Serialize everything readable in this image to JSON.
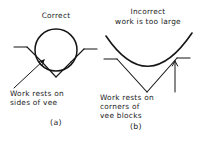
{
  "figure": {
    "background_color": "#ffffff",
    "ink_color": "#151515",
    "panels": [
      {
        "id": "a",
        "heading": "Correct",
        "annotation_line_1": "Work rests on",
        "annotation_line_2": "sides of vee",
        "caption": "(a)"
      },
      {
        "id": "b",
        "heading_line_1": "Incorrect",
        "heading_line_2": "work is too large",
        "annotation_line_1": "Work rests on",
        "annotation_line_2": "corners of",
        "annotation_line_3": "vee blocks",
        "caption": "(b)"
      }
    ]
  }
}
